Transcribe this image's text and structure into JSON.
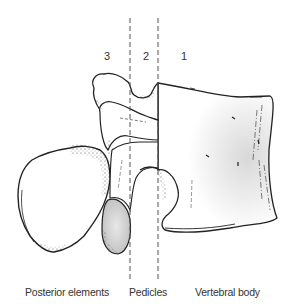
{
  "figure": {
    "type": "anatomical-line-drawing",
    "region_numbers": [
      {
        "id": "region-3",
        "label": "3",
        "x": 104
      },
      {
        "id": "region-2",
        "label": "2",
        "x": 143
      },
      {
        "id": "region-1",
        "label": "1",
        "x": 181
      }
    ],
    "region_labels": [
      {
        "id": "posterior-elements",
        "label": "Posterior elements",
        "x": 25
      },
      {
        "id": "pedicles",
        "label": "Pedicles",
        "x": 129
      },
      {
        "id": "vertebral-body",
        "label": "Vertebral body",
        "x": 195
      }
    ],
    "divider_lines": [
      {
        "id": "divider-left",
        "x": 130
      },
      {
        "id": "divider-right",
        "x": 158
      }
    ],
    "colors": {
      "ink": "#222222",
      "dash": "#555555",
      "shade": "#cfcfcf",
      "background": "#ffffff"
    }
  }
}
